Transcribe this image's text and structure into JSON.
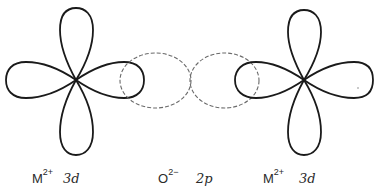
{
  "figure": {
    "colors": {
      "d_orbital_stroke": "#1a1a1a",
      "p_orbital_stroke": "#6a6a6a",
      "background": "#ffffff",
      "text": "#2a2a2a"
    },
    "ions": [
      {
        "id": "left-metal",
        "symbol": "M",
        "charge": "2+",
        "orbital": "3d",
        "orbital_style": "solid",
        "center": [
          76,
          80
        ]
      },
      {
        "id": "oxygen",
        "symbol": "O",
        "charge": "2−",
        "orbital": "2p",
        "orbital_style": "dashed",
        "center": [
          190,
          80
        ]
      },
      {
        "id": "right-metal",
        "symbol": "M",
        "charge": "2+",
        "orbital": "3d",
        "orbital_style": "solid",
        "center": [
          304,
          80
        ]
      }
    ]
  }
}
